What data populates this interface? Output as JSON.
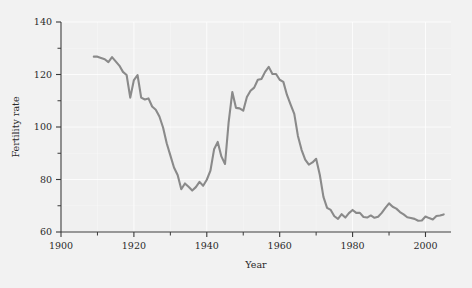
{
  "figure": {
    "background_color": "#f2f2f2",
    "plot_background_color": "#f0f0f0",
    "grid_color": "#ffffff",
    "axis_color": "#3a3a3a",
    "series_color": "#8a8a8a"
  },
  "chart_data": {
    "type": "line",
    "title": "",
    "xlabel": "Year",
    "ylabel": "Fertility rate",
    "xlim": [
      1900,
      2007
    ],
    "ylim": [
      60,
      140
    ],
    "grid": true,
    "legend": "none",
    "xticks": [
      1900,
      1920,
      1940,
      1960,
      1980,
      2000
    ],
    "xtick_labels": [
      "1900",
      "1920",
      "1940",
      "1960",
      "1980",
      "2000"
    ],
    "xticks_minor": [
      1910,
      1930,
      1950,
      1970,
      1990
    ],
    "yticks": [
      60,
      80,
      100,
      120,
      140
    ],
    "ytick_labels": [
      "60",
      "80",
      "100",
      "120",
      "140"
    ],
    "yticks_minor": [
      70,
      90,
      110,
      130
    ],
    "series": [
      {
        "name": "Fertility rate",
        "color": "#8a8a8a",
        "x": [
          1909,
          1910,
          1911,
          1912,
          1913,
          1914,
          1915,
          1916,
          1917,
          1918,
          1919,
          1920,
          1921,
          1922,
          1923,
          1924,
          1925,
          1926,
          1927,
          1928,
          1929,
          1930,
          1931,
          1932,
          1933,
          1934,
          1935,
          1936,
          1937,
          1938,
          1939,
          1940,
          1941,
          1942,
          1943,
          1944,
          1945,
          1946,
          1947,
          1948,
          1949,
          1950,
          1951,
          1952,
          1953,
          1954,
          1955,
          1956,
          1957,
          1958,
          1959,
          1960,
          1961,
          1962,
          1963,
          1964,
          1965,
          1966,
          1967,
          1968,
          1969,
          1970,
          1971,
          1972,
          1973,
          1974,
          1975,
          1976,
          1977,
          1978,
          1979,
          1980,
          1981,
          1982,
          1983,
          1984,
          1985,
          1986,
          1987,
          1988,
          1989,
          1990,
          1991,
          1992,
          1993,
          1994,
          1995,
          1996,
          1997,
          1998,
          1999,
          2000,
          2001,
          2002,
          2003,
          2004,
          2005
        ],
        "y": [
          126.8,
          126.8,
          126.3,
          125.8,
          124.7,
          126.6,
          125.0,
          123.4,
          121.0,
          119.8,
          111.2,
          117.9,
          119.8,
          111.2,
          110.5,
          110.9,
          107.8,
          106.6,
          104.0,
          99.8,
          93.8,
          89.2,
          84.6,
          81.7,
          76.3,
          78.5,
          77.2,
          75.8,
          77.1,
          79.1,
          77.6,
          79.9,
          83.4,
          91.5,
          94.3,
          88.8,
          85.9,
          101.9,
          113.3,
          107.3,
          107.1,
          106.2,
          111.4,
          113.8,
          115.0,
          118.0,
          118.3,
          121.0,
          122.9,
          120.2,
          120.2,
          118.0,
          117.2,
          112.2,
          108.5,
          105.0,
          96.6,
          91.3,
          87.6,
          85.7,
          86.5,
          87.9,
          81.8,
          73.4,
          69.2,
          68.4,
          66.0,
          65.0,
          66.8,
          65.5,
          67.2,
          68.4,
          67.3,
          67.3,
          65.7,
          65.5,
          66.3,
          65.4,
          65.8,
          67.3,
          69.2,
          70.9,
          69.6,
          68.9,
          67.6,
          66.7,
          65.6,
          65.3,
          65.0,
          64.3,
          64.4,
          65.9,
          65.3,
          64.8,
          66.1,
          66.3,
          66.7
        ]
      }
    ]
  },
  "axes": {
    "x_axis_title": "Year",
    "y_axis_title": "Fertility rate"
  }
}
